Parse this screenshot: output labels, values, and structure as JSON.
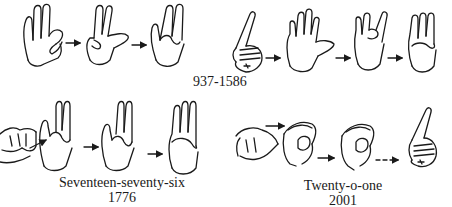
{
  "figure": {
    "groups": [
      {
        "id": "937-1586",
        "caption_lines": [
          "937-1586"
        ],
        "hands": 7,
        "arrows": [
          "solid",
          "solid",
          "solid",
          "solid",
          "solid"
        ]
      },
      {
        "id": "1776",
        "caption_lines": [
          "Seventeen-seventy-six",
          "1776"
        ],
        "hands": 4,
        "arrows": [
          "solid",
          "solid",
          "solid"
        ]
      },
      {
        "id": "2001",
        "caption_lines": [
          "Twenty-o-one",
          "2001"
        ],
        "hands": 4,
        "arrows": [
          "solid",
          "solid",
          "dashed"
        ]
      }
    ]
  },
  "labels": {
    "top_caption": "937-1586",
    "bottom_left_caption": "Seventeen-seventy-six",
    "bottom_left_number": "1776",
    "bottom_right_caption": "Twenty-o-one",
    "bottom_right_number": "2001"
  },
  "colors": {
    "ink": "#1a1a1a",
    "background": "#ffffff"
  }
}
